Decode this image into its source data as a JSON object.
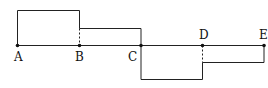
{
  "diagram": {
    "type": "piecewise-step-graph",
    "baseline": {
      "y": 45.5,
      "x_start": 17.5,
      "x_end": 264
    },
    "points": [
      {
        "id": "A",
        "label": "A",
        "x": 17.5,
        "y": 45.5,
        "label_x": 14,
        "label_y": 61
      },
      {
        "id": "B",
        "label": "B",
        "x": 79.5,
        "y": 45.5,
        "label_x": 75,
        "label_y": 61
      },
      {
        "id": "C",
        "label": "C",
        "x": 141,
        "y": 45.5,
        "label_x": 128,
        "label_y": 61
      },
      {
        "id": "D",
        "label": "D",
        "x": 202.5,
        "y": 45.5,
        "label_x": 199,
        "label_y": 39
      },
      {
        "id": "E",
        "label": "E",
        "x": 264,
        "y": 45.5,
        "label_x": 259,
        "label_y": 39
      }
    ],
    "segments": [
      {
        "from": "A",
        "to": "B",
        "level": "high",
        "y": 10.5
      },
      {
        "from": "B",
        "to": "C",
        "level": "medium-high",
        "y": 28.5
      },
      {
        "from": "C",
        "to": "D",
        "level": "low",
        "y": 79.5
      },
      {
        "from": "D",
        "to": "E",
        "level": "medium-low",
        "y": 62.5
      }
    ],
    "colors": {
      "line": "#222222",
      "point": "#111111",
      "background": "#ffffff"
    }
  }
}
